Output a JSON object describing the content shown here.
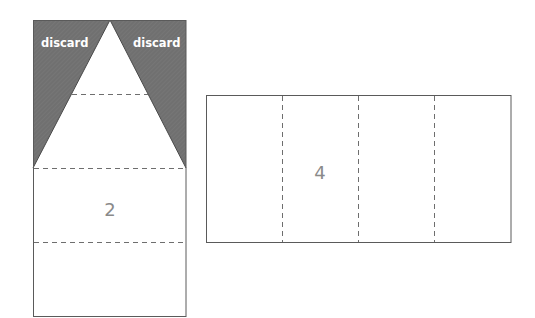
{
  "colors": {
    "outline": "#5a5a5a",
    "dash": "#6e6e6e",
    "discard_fill": "#6f6f6f",
    "discard_text": "#ffffff",
    "number_text": "#8a8a8a",
    "background": "#ffffff"
  },
  "left_panel": {
    "discard_labels": [
      "discard",
      "discard"
    ],
    "section_number": "2"
  },
  "right_panel": {
    "section_number": "4"
  }
}
